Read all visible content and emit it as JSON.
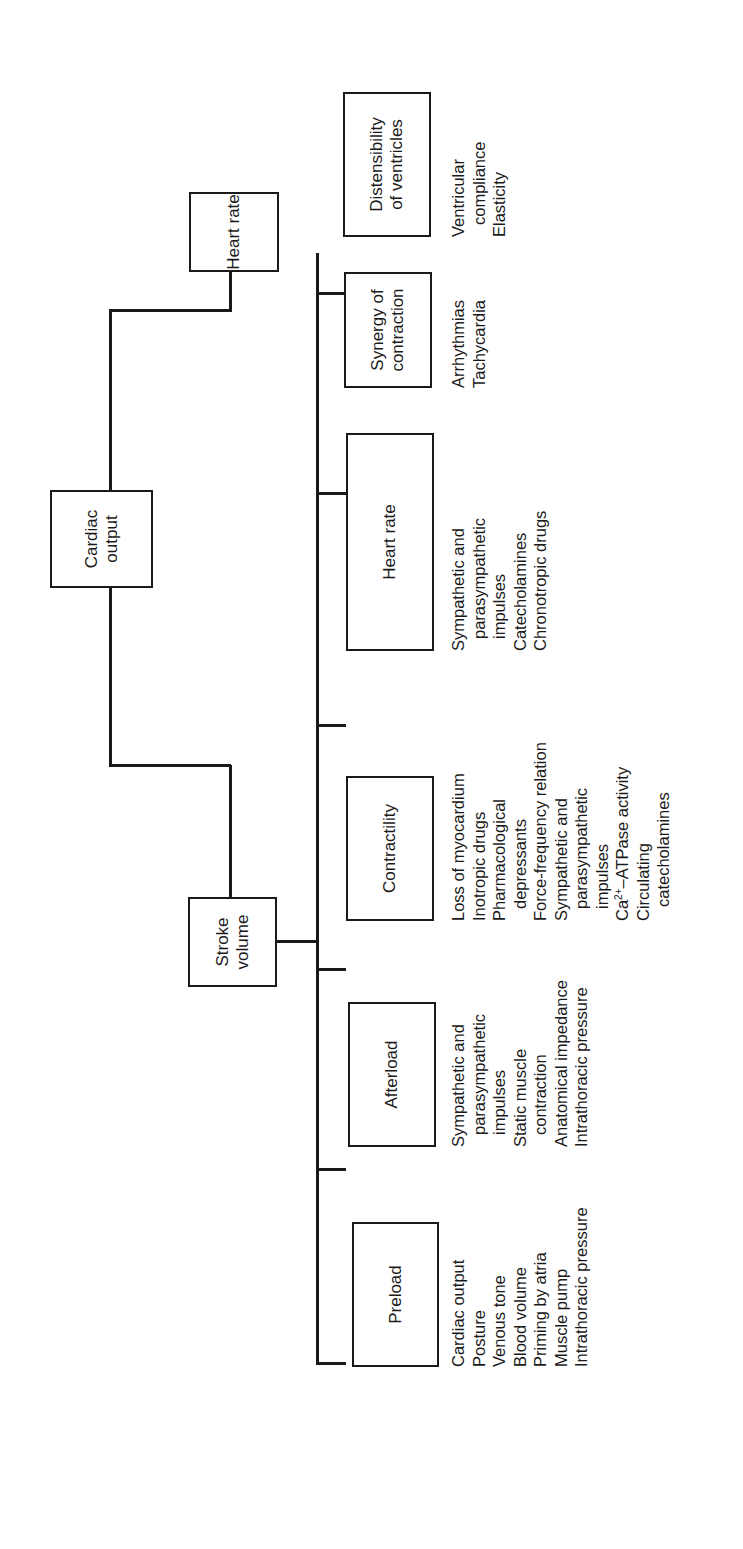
{
  "diagram": {
    "root": {
      "label": "Cardiac output"
    },
    "level1": [
      {
        "label": "Heart rate"
      },
      {
        "label": "Stroke volume"
      }
    ],
    "level2": [
      {
        "label": "Preload",
        "factors": [
          "Cardiac output",
          "Posture",
          "Venous tone",
          "Blood volume",
          "Priming by atria",
          "Muscle pump",
          "Intrathoracic pressure"
        ]
      },
      {
        "label": "Afterload",
        "factors": [
          "Sympathetic and",
          "parasympathetic",
          "impulses",
          "Static muscle",
          "contraction",
          "Anatomical impedance",
          "Intrathoracic pressure"
        ]
      },
      {
        "label": "Contractility",
        "factors": [
          "Loss of myocardium",
          "Inotropic drugs",
          "Pharmacological",
          "depressants",
          "Force-frequency relation",
          "Sympathetic and",
          "parasympathetic",
          "impulses",
          "Ca",
          "2+",
          "–ATPase activity",
          "Circulating",
          "catecholamines"
        ]
      },
      {
        "label": "Heart rate",
        "factors": [
          "Sympathetic and",
          "parasympathetic",
          "impulses",
          "Catecholamines",
          "Chronotropic drugs"
        ]
      },
      {
        "label_line1": "Synergy of",
        "label_line2": "contraction",
        "factors": [
          "Arrhythmias",
          "Tachycardia"
        ]
      },
      {
        "label_line1": "Distensibility",
        "label_line2": "of ventricles",
        "factors": [
          "Ventricular",
          "compliance",
          "Elasticity"
        ]
      }
    ]
  }
}
